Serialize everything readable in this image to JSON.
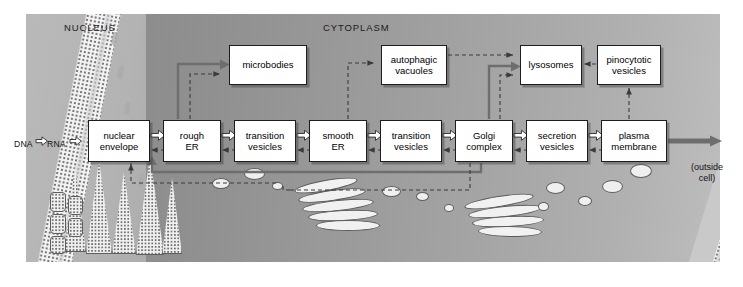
{
  "diagram": {
    "regions": [
      {
        "name": "nucleus",
        "label": "NUCLEUS"
      },
      {
        "name": "cytoplasm",
        "label": "CYTOPLASM"
      }
    ],
    "source_label": {
      "dna": "DNA",
      "rna": "RNA"
    },
    "outside_label": "(outside\ncell)",
    "outside_label_line1": "(outside",
    "outside_label_line2": "cell)",
    "boxes": [
      {
        "id": "nuclear-envelope",
        "label": "nuclear\nenvelope",
        "line1": "nuclear",
        "line2": "envelope",
        "x": 88,
        "y": 120,
        "w": 62,
        "h": 42
      },
      {
        "id": "rough-er",
        "label": "rough\nER",
        "line1": "rough",
        "line2": "ER",
        "x": 163,
        "y": 120,
        "w": 58,
        "h": 42
      },
      {
        "id": "transition-vesicles-1",
        "label": "transition\nvesicles",
        "line1": "transition",
        "line2": "vesicles",
        "x": 234,
        "y": 120,
        "w": 62,
        "h": 42
      },
      {
        "id": "smooth-er",
        "label": "smooth\nER",
        "line1": "smooth",
        "line2": "ER",
        "x": 309,
        "y": 120,
        "w": 58,
        "h": 42
      },
      {
        "id": "transition-vesicles-2",
        "label": "transition\nvesicles",
        "line1": "transition",
        "line2": "vesicles",
        "x": 380,
        "y": 120,
        "w": 62,
        "h": 42
      },
      {
        "id": "golgi-complex",
        "label": "Golgi\ncomplex",
        "line1": "Golgi",
        "line2": "complex",
        "x": 455,
        "y": 120,
        "w": 58,
        "h": 42
      },
      {
        "id": "secretion-vesicles",
        "label": "secretion\nvesicles",
        "line1": "secretion",
        "line2": "vesicles",
        "x": 526,
        "y": 120,
        "w": 62,
        "h": 42
      },
      {
        "id": "plasma-membrane",
        "label": "plasma\nmembrane",
        "line1": "plasma",
        "line2": "membrane",
        "x": 601,
        "y": 120,
        "w": 66,
        "h": 42
      },
      {
        "id": "microbodies",
        "label": "microbodies",
        "line1": "microbodies",
        "line2": "",
        "x": 229,
        "y": 45,
        "w": 78,
        "h": 40
      },
      {
        "id": "autophagic-vacuoles",
        "label": "autophagic\nvacuoles",
        "line1": "autophagic",
        "line2": "vacuoles",
        "x": 381,
        "y": 45,
        "w": 66,
        "h": 40
      },
      {
        "id": "lysosomes",
        "label": "lysosomes",
        "line1": "lysosomes",
        "line2": "",
        "x": 520,
        "y": 45,
        "w": 62,
        "h": 40
      },
      {
        "id": "pinocytotic-vesicles",
        "label": "pinocytotic\nvesicles",
        "line1": "pinocytotic",
        "line2": "vesicles",
        "x": 597,
        "y": 45,
        "w": 64,
        "h": 40
      }
    ],
    "flow_arrows": [
      {
        "from": "DNA",
        "to": "RNA",
        "style": "hollow-block"
      },
      {
        "from": "RNA",
        "to": "nuclear-envelope",
        "style": "hollow-block"
      },
      {
        "from": "nuclear-envelope",
        "to": "rough-er",
        "style": "hollow-block"
      },
      {
        "from": "rough-er",
        "to": "transition-vesicles-1",
        "style": "hollow-block"
      },
      {
        "from": "transition-vesicles-1",
        "to": "smooth-er",
        "style": "hollow-block"
      },
      {
        "from": "smooth-er",
        "to": "transition-vesicles-2",
        "style": "hollow-block"
      },
      {
        "from": "transition-vesicles-2",
        "to": "golgi-complex",
        "style": "hollow-block"
      },
      {
        "from": "golgi-complex",
        "to": "secretion-vesicles",
        "style": "hollow-block"
      },
      {
        "from": "secretion-vesicles",
        "to": "plasma-membrane",
        "style": "hollow-block"
      },
      {
        "from": "plasma-membrane",
        "to": "outside-cell",
        "style": "solid-gray-thick"
      },
      {
        "from": "rough-er",
        "to": "microbodies",
        "style": "solid-gray-double"
      },
      {
        "from": "golgi-complex",
        "to": "lysosomes",
        "style": "solid-gray-double"
      },
      {
        "from": "golgi-complex",
        "to": "transition-vesicles-1",
        "style": "solid-gray-double-return"
      }
    ],
    "dashed_arrows": [
      {
        "from": "rough-er",
        "to": "microbodies"
      },
      {
        "from": "nuclear-envelope",
        "to": "rough-er"
      },
      {
        "from": "transition-vesicles-1",
        "to": "smooth-er"
      },
      {
        "from": "smooth-er",
        "to": "transition-vesicles-2"
      },
      {
        "from": "transition-vesicles-2",
        "to": "golgi-complex"
      },
      {
        "from": "golgi-complex",
        "to": "secretion-vesicles"
      },
      {
        "from": "secretion-vesicles",
        "to": "plasma-membrane"
      },
      {
        "from": "smooth-er",
        "to": "autophagic-vacuoles"
      },
      {
        "from": "autophagic-vacuoles",
        "to": "lysosomes"
      },
      {
        "from": "golgi-complex",
        "to": "lysosomes"
      },
      {
        "from": "pinocytotic-vesicles",
        "to": "lysosomes"
      },
      {
        "from": "plasma-membrane",
        "to": "pinocytotic-vesicles"
      },
      {
        "from": "nuclear-envelope",
        "to": "return-path-bottom"
      },
      {
        "from": "golgi-complex",
        "to": "return-path-bottom"
      }
    ],
    "colors": {
      "nucleus_fill": "#b3b3b3",
      "cytoplasm_fill": "#9b9b9b",
      "membrane_stipple": "#f2f2f2",
      "box_fill": "#ffffff",
      "box_border": "#1d1d1d",
      "arrow_gray": "#6e6e6e",
      "text": "#000000"
    }
  }
}
